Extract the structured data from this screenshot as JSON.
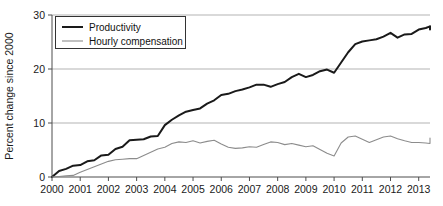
{
  "chart_data": {
    "type": "line",
    "title": "",
    "subtitle": "",
    "xlabel": "",
    "ylabel": "Percent change since 2000",
    "xlim": [
      2000,
      2013.4
    ],
    "ylim": [
      0,
      30
    ],
    "yticks": [
      0,
      10,
      20,
      30
    ],
    "ytick_labels": [
      "0",
      "10",
      "20",
      "30"
    ],
    "xticks": [
      2000,
      2001,
      2002,
      2003,
      2004,
      2005,
      2006,
      2007,
      2008,
      2009,
      2010,
      2011,
      2012,
      2013
    ],
    "xtick_labels": [
      "2000",
      "2001",
      "2002",
      "2003",
      "2004",
      "2005",
      "2006",
      "2007",
      "2008",
      "2009",
      "2010",
      "2011",
      "2012",
      "2013"
    ],
    "grid": "horizontal",
    "legend_position": "top-left",
    "series": [
      {
        "name": "Productivity",
        "color": "#1a1a1a",
        "width": 2.0,
        "x": [
          2000.0,
          2000.25,
          2000.5,
          2000.75,
          2001.0,
          2001.25,
          2001.5,
          2001.75,
          2002.0,
          2002.25,
          2002.5,
          2002.75,
          2003.0,
          2003.25,
          2003.5,
          2003.75,
          2004.0,
          2004.25,
          2004.5,
          2004.75,
          2005.0,
          2005.25,
          2005.5,
          2005.75,
          2006.0,
          2006.25,
          2006.5,
          2006.75,
          2007.0,
          2007.25,
          2007.5,
          2007.75,
          2008.0,
          2008.25,
          2008.5,
          2008.75,
          2009.0,
          2009.25,
          2009.5,
          2009.75,
          2010.0,
          2010.25,
          2010.5,
          2010.75,
          2011.0,
          2011.25,
          2011.5,
          2011.75,
          2012.0,
          2012.25,
          2012.5,
          2012.75,
          2013.0,
          2013.25
        ],
        "values": [
          0.0,
          1.1,
          1.5,
          2.1,
          2.2,
          2.9,
          3.1,
          4.0,
          4.1,
          5.2,
          5.6,
          6.8,
          6.9,
          7.0,
          7.5,
          7.6,
          9.6,
          10.6,
          11.4,
          12.1,
          12.4,
          12.7,
          13.6,
          14.2,
          15.2,
          15.4,
          15.9,
          16.2,
          16.6,
          17.1,
          17.1,
          16.7,
          17.2,
          17.6,
          18.5,
          19.1,
          18.5,
          18.9,
          19.6,
          19.9,
          19.3,
          21.2,
          23.1,
          24.6,
          25.1,
          25.3,
          25.5,
          26.0,
          26.7,
          25.8,
          26.4,
          26.5,
          27.3,
          27.6
        ],
        "values_tail": [
          27.9,
          27.3,
          27.4,
          27.9
        ]
      },
      {
        "name": "Hourly compensation",
        "color": "#8c8c8c",
        "width": 1.1,
        "x": [
          2000.0,
          2000.25,
          2000.5,
          2000.75,
          2001.0,
          2001.25,
          2001.5,
          2001.75,
          2002.0,
          2002.25,
          2002.5,
          2002.75,
          2003.0,
          2003.25,
          2003.5,
          2003.75,
          2004.0,
          2004.25,
          2004.5,
          2004.75,
          2005.0,
          2005.25,
          2005.5,
          2005.75,
          2006.0,
          2006.25,
          2006.5,
          2006.75,
          2007.0,
          2007.25,
          2007.5,
          2007.75,
          2008.0,
          2008.25,
          2008.5,
          2008.75,
          2009.0,
          2009.25,
          2009.5,
          2009.75,
          2010.0,
          2010.25,
          2010.5,
          2010.75,
          2011.0,
          2011.25,
          2011.5,
          2011.75,
          2012.0,
          2012.25,
          2012.5,
          2012.75,
          2013.0,
          2013.25
        ],
        "values": [
          0.0,
          0.1,
          0.2,
          0.3,
          0.9,
          1.4,
          1.9,
          2.4,
          2.9,
          3.2,
          3.3,
          3.4,
          3.4,
          4.0,
          4.6,
          5.2,
          5.5,
          6.2,
          6.5,
          6.4,
          6.7,
          6.3,
          6.6,
          6.8,
          6.1,
          5.5,
          5.3,
          5.4,
          5.6,
          5.5,
          6.0,
          6.5,
          6.4,
          6.0,
          6.2,
          5.9,
          5.6,
          5.8,
          5.1,
          4.4,
          3.9,
          6.3,
          7.4,
          7.6,
          7.0,
          6.4,
          6.9,
          7.4,
          7.6,
          7.1,
          6.7,
          6.4,
          6.4,
          6.3
        ],
        "values_tail": [
          6.2,
          6.4,
          6.3,
          7.2
        ]
      }
    ]
  },
  "legend": {
    "entries": [
      {
        "label": "Productivity",
        "color": "#1a1a1a"
      },
      {
        "label": "Hourly compensation",
        "color": "#8c8c8c"
      }
    ]
  },
  "axes": {
    "y_axis_title": "Percent change since 2000"
  }
}
